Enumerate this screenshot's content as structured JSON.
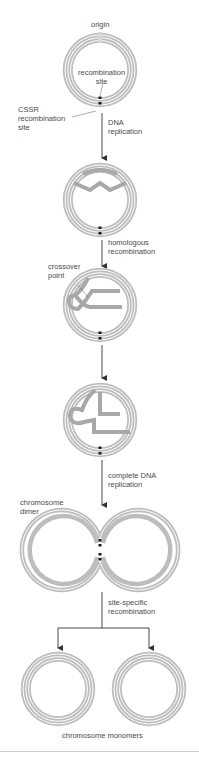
{
  "figure": {
    "colors": {
      "outer_strand": "#b8b8b8",
      "inner_strand": "#9a9a9a",
      "gap": "#ffffff",
      "site_marker": "#1a1a1a",
      "arrow": "#333333",
      "text": "#4a4a4a"
    },
    "stages": [
      {
        "id": "circular-chromosome",
        "labels": {
          "origin": "origin",
          "recombination_site": "recombination\nsite",
          "cssr_site": "CSSR\nrecombination\nsite"
        }
      },
      {
        "id": "replication-bubble",
        "step_label": "DNA\nreplication"
      },
      {
        "id": "crossover",
        "step_label": "homologous\nrecombination",
        "labels": {
          "crossover_point": "crossover\npoint"
        }
      },
      {
        "id": "post-crossover",
        "step_label": ""
      },
      {
        "id": "dimer",
        "step_label": "complete DNA\nreplication",
        "labels": {
          "dimer": "chromosome\ndimer"
        }
      },
      {
        "id": "monomers",
        "step_label": "site-specific\nrecombination",
        "labels": {
          "monomers": "chromosome monomers"
        }
      }
    ]
  }
}
